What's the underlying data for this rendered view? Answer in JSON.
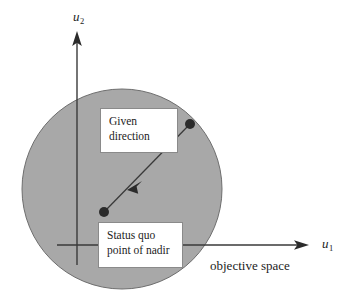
{
  "figure": {
    "width": 360,
    "height": 305,
    "background_color": "#ffffff",
    "region": {
      "name": "feasible-objective-region",
      "shape": "circle",
      "center_x": 122,
      "center_y": 189,
      "radius": 100,
      "fill_color": "#a8a8a8",
      "stroke_color": "#6e6e6e"
    }
  },
  "axes": {
    "stroke_color": "#3a3a3a",
    "x_axis": {
      "label": "u",
      "subscript": "1",
      "y": 245,
      "x_start": 57,
      "x_end": 308,
      "arrow": "right"
    },
    "y_axis": {
      "label": "u",
      "subscript": "2",
      "x": 77,
      "y_start": 265,
      "y_end": 34,
      "arrow": "up"
    }
  },
  "callouts": [
    {
      "id": "given-direction",
      "text": "Given\ndirection",
      "x": 100,
      "y": 108,
      "width": 78,
      "height": 45,
      "background_color": "#ffffff",
      "border_color": "#8a8a8a"
    },
    {
      "id": "status-quo",
      "text": "Status  quo\npoint of nadir",
      "x": 98,
      "y": 222,
      "width": 85,
      "height": 46,
      "background_color": "#ffffff",
      "border_color": "#8a8a8a"
    }
  ],
  "direction_vector": {
    "name": "given-direction-vector",
    "stroke_color": "#3a3a3a",
    "start_point": {
      "name": "status-quo-point",
      "x": 104,
      "y": 212
    },
    "end_point": {
      "name": "direction-endpoint",
      "x": 190,
      "y": 124
    },
    "midpoint_arrow": {
      "x": 135,
      "y": 182,
      "direction": "down-left"
    },
    "marker_color": "#2b2b2b",
    "marker_radius": 5
  },
  "annotations": {
    "objective_space_label": "objective space"
  }
}
